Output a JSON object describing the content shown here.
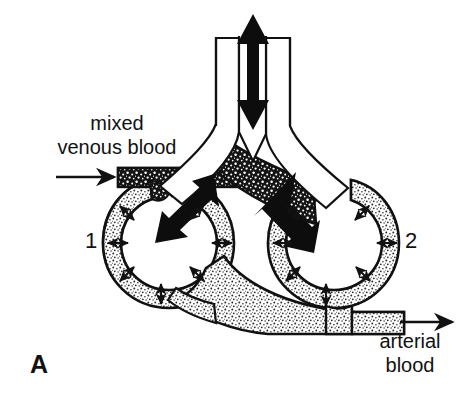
{
  "figure": {
    "panel_label": "A",
    "caption_labels": {
      "inflow": "mixed\nvenous blood",
      "outflow": "arterial\nblood"
    },
    "alveolus_numbers": {
      "left": "1",
      "right": "2"
    }
  },
  "colors": {
    "ink": "#111111",
    "background": "#ffffff",
    "deoxygenated_vessel": "#1a1a1a",
    "oxygenated_vessel": "#d8d8d8",
    "airway_lumen": "#ffffff",
    "arrow_fill": "#0d0d0d"
  },
  "diagram": {
    "type": "alveolar-gas-exchange-schematic",
    "structures": [
      {
        "name": "trachea",
        "description": "vertical airway at top with double-headed ventilation arrow"
      },
      {
        "name": "carina",
        "description": "bifurcation point of the airway"
      },
      {
        "name": "left-bronchus",
        "description": "airway branch leading to alveolus 1"
      },
      {
        "name": "right-bronchus",
        "description": "airway branch leading to alveolus 2"
      },
      {
        "name": "alveolus-1",
        "description": "left alveolar sac, number 1"
      },
      {
        "name": "alveolus-2",
        "description": "right alveolar sac, number 2"
      },
      {
        "name": "pulmonary-artery",
        "description": "dark stippled vessel carrying mixed venous blood in from the left"
      },
      {
        "name": "pulmonary-vein",
        "description": "light stippled vessel carrying arterial blood out to the right"
      },
      {
        "name": "capillary-network",
        "description": "vessel wall surrounding each alveolus, shading from dark to light"
      }
    ],
    "arrows": {
      "ventilation_trachea": "double-headed vertical arrow indicating bidirectional airflow",
      "ventilation_left_branch": "double-headed diagonal arrow into alveolus 1",
      "ventilation_right_branch": "double-headed diagonal arrow into alveolus 2",
      "diffusion_radial": "small double-headed arrows crossing the alveolar-capillary membrane",
      "blood_inflow": "single arrow pointing right into the dark vessel",
      "blood_outflow": "single arrow pointing right out of the light vessel"
    }
  }
}
